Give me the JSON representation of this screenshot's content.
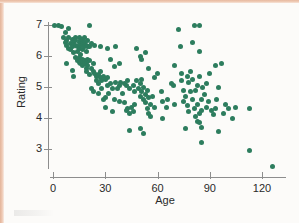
{
  "figure": {
    "background_color": "#fcfbf9",
    "page_edge_color": "#e7b9a0",
    "marker_color": "#2d7d5e",
    "axis_color": "#8d8d8d"
  },
  "chart_data": {
    "type": "scatter",
    "title": "",
    "xlabel": "Age",
    "ylabel": "Rating",
    "xlim": [
      -3,
      132
    ],
    "ylim": [
      2.2,
      7.25
    ],
    "xticks": [
      0,
      30,
      60,
      90,
      120
    ],
    "yticks": [
      3,
      4,
      5,
      6,
      7
    ],
    "xtick_labels": [
      "0",
      "30",
      "60",
      "90",
      "120"
    ],
    "ytick_labels": [
      "3",
      "4",
      "5",
      "6",
      "7"
    ],
    "grid": false,
    "legend": null,
    "marker_size_px": 5,
    "n_points": 196,
    "points": [
      [
        1,
        7.0
      ],
      [
        3,
        7.0
      ],
      [
        5,
        6.95
      ],
      [
        6,
        6.6
      ],
      [
        7,
        6.75
      ],
      [
        7,
        6.45
      ],
      [
        8,
        6.5
      ],
      [
        8,
        6.35
      ],
      [
        9,
        6.6
      ],
      [
        9,
        6.25
      ],
      [
        9,
        6.9
      ],
      [
        10,
        6.4
      ],
      [
        10,
        6.2
      ],
      [
        11,
        6.55
      ],
      [
        11,
        6.3
      ],
      [
        12,
        6.45
      ],
      [
        12,
        6.1
      ],
      [
        13,
        6.6
      ],
      [
        13,
        6.35
      ],
      [
        13,
        6.5
      ],
      [
        14,
        6.3
      ],
      [
        14,
        6.15
      ],
      [
        15,
        6.45
      ],
      [
        15,
        6.6
      ],
      [
        15,
        6.25
      ],
      [
        16,
        6.5
      ],
      [
        16,
        6.35
      ],
      [
        16,
        6.05
      ],
      [
        17,
        6.4
      ],
      [
        17,
        6.55
      ],
      [
        17,
        6.2
      ],
      [
        18,
        6.45
      ],
      [
        18,
        6.3
      ],
      [
        18,
        6.6
      ],
      [
        19,
        6.35
      ],
      [
        19,
        6.15
      ],
      [
        20,
        6.3
      ],
      [
        20,
        6.5
      ],
      [
        21,
        7.0
      ],
      [
        21,
        6.3
      ],
      [
        22,
        6.4
      ],
      [
        8,
        5.75
      ],
      [
        11,
        5.55
      ],
      [
        13,
        5.95
      ],
      [
        14,
        5.85
      ],
      [
        15,
        5.8
      ],
      [
        15,
        5.95
      ],
      [
        16,
        5.85
      ],
      [
        16,
        5.75
      ],
      [
        17,
        5.9
      ],
      [
        17,
        5.8
      ],
      [
        17,
        5.7
      ],
      [
        18,
        5.85
      ],
      [
        18,
        5.75
      ],
      [
        19,
        5.8
      ],
      [
        19,
        5.6
      ],
      [
        20,
        5.9
      ],
      [
        20,
        5.7
      ],
      [
        21,
        5.85
      ],
      [
        22,
        5.6
      ],
      [
        23,
        5.75
      ],
      [
        12,
        5.35
      ],
      [
        19,
        5.5
      ],
      [
        21,
        5.4
      ],
      [
        23,
        5.5
      ],
      [
        24,
        5.45
      ],
      [
        25,
        5.35
      ],
      [
        26,
        5.4
      ],
      [
        27,
        5.3
      ],
      [
        27,
        5.5
      ],
      [
        28,
        5.2
      ],
      [
        29,
        5.35
      ],
      [
        30,
        5.25
      ],
      [
        31,
        5.3
      ],
      [
        25,
        5.2
      ],
      [
        26,
        5.1
      ],
      [
        24,
        6.35
      ],
      [
        27,
        6.3
      ],
      [
        31,
        6.25
      ],
      [
        36,
        6.3
      ],
      [
        33,
        5.9
      ],
      [
        35,
        5.65
      ],
      [
        38,
        5.75
      ],
      [
        22,
        4.95
      ],
      [
        23,
        4.85
      ],
      [
        26,
        4.8
      ],
      [
        28,
        4.95
      ],
      [
        29,
        4.6
      ],
      [
        30,
        4.65
      ],
      [
        31,
        5.05
      ],
      [
        32,
        4.8
      ],
      [
        33,
        5.1
      ],
      [
        34,
        4.95
      ],
      [
        35,
        4.6
      ],
      [
        36,
        5.15
      ],
      [
        37,
        4.95
      ],
      [
        38,
        5.05
      ],
      [
        39,
        5.15
      ],
      [
        40,
        4.8
      ],
      [
        41,
        5.1
      ],
      [
        42,
        5.05
      ],
      [
        43,
        5.2
      ],
      [
        44,
        4.95
      ],
      [
        30,
        4.35
      ],
      [
        34,
        4.2
      ],
      [
        38,
        4.55
      ],
      [
        41,
        4.5
      ],
      [
        42,
        4.25
      ],
      [
        43,
        4.3
      ],
      [
        44,
        4.15
      ],
      [
        45,
        4.35
      ],
      [
        46,
        4.2
      ],
      [
        47,
        4.45
      ],
      [
        44,
        3.6
      ],
      [
        50,
        3.65
      ],
      [
        52,
        3.5
      ],
      [
        46,
        5.05
      ],
      [
        47,
        4.85
      ],
      [
        48,
        5.2
      ],
      [
        49,
        4.95
      ],
      [
        50,
        5.1
      ],
      [
        50,
        4.7
      ],
      [
        51,
        5.25
      ],
      [
        51,
        4.85
      ],
      [
        52,
        4.6
      ],
      [
        52,
        5.0
      ],
      [
        53,
        4.75
      ],
      [
        53,
        4.5
      ],
      [
        54,
        4.9
      ],
      [
        54,
        4.3
      ],
      [
        55,
        4.65
      ],
      [
        55,
        4.15
      ],
      [
        56,
        4.45
      ],
      [
        56,
        4.05
      ],
      [
        57,
        4.7
      ],
      [
        58,
        4.35
      ],
      [
        48,
        6.25
      ],
      [
        50,
        6.0
      ],
      [
        51,
        5.9
      ],
      [
        53,
        6.1
      ],
      [
        55,
        5.6
      ],
      [
        58,
        5.3
      ],
      [
        60,
        5.45
      ],
      [
        62,
        4.85
      ],
      [
        63,
        4.55
      ],
      [
        63,
        4.0
      ],
      [
        65,
        4.35
      ],
      [
        66,
        4.6
      ],
      [
        68,
        5.1
      ],
      [
        69,
        5.05
      ],
      [
        70,
        5.7
      ],
      [
        70,
        4.45
      ],
      [
        72,
        6.85
      ],
      [
        73,
        6.3
      ],
      [
        74,
        5.45
      ],
      [
        74,
        5.2
      ],
      [
        75,
        4.9
      ],
      [
        75,
        4.55
      ],
      [
        76,
        4.7
      ],
      [
        76,
        3.65
      ],
      [
        77,
        5.35
      ],
      [
        77,
        4.4
      ],
      [
        78,
        5.15
      ],
      [
        78,
        4.2
      ],
      [
        79,
        5.5
      ],
      [
        79,
        4.85
      ],
      [
        80,
        6.45
      ],
      [
        80,
        5.25
      ],
      [
        80,
        4.6
      ],
      [
        81,
        7.0
      ],
      [
        81,
        4.3
      ],
      [
        82,
        4.9
      ],
      [
        82,
        4.05
      ],
      [
        83,
        5.05
      ],
      [
        83,
        4.45
      ],
      [
        83,
        3.9
      ],
      [
        84,
        7.0
      ],
      [
        84,
        6.15
      ],
      [
        84,
        5.35
      ],
      [
        84,
        4.15
      ],
      [
        84,
        3.85
      ],
      [
        85,
        4.6
      ],
      [
        85,
        4.25
      ],
      [
        85,
        3.7
      ],
      [
        85,
        3.2
      ],
      [
        86,
        5.0
      ],
      [
        87,
        4.75
      ],
      [
        88,
        5.1
      ],
      [
        88,
        4.35
      ],
      [
        89,
        4.55
      ],
      [
        90,
        5.45
      ],
      [
        91,
        4.25
      ],
      [
        92,
        4.1
      ],
      [
        93,
        5.7
      ],
      [
        93,
        4.3
      ],
      [
        94,
        4.6
      ],
      [
        95,
        5.0
      ],
      [
        95,
        3.55
      ],
      [
        97,
        5.75
      ],
      [
        98,
        4.15
      ],
      [
        99,
        4.45
      ],
      [
        101,
        4.3
      ],
      [
        103,
        4.0
      ],
      [
        105,
        4.35
      ],
      [
        113,
        4.3
      ],
      [
        113,
        2.95
      ],
      [
        126,
        2.45
      ]
    ]
  }
}
